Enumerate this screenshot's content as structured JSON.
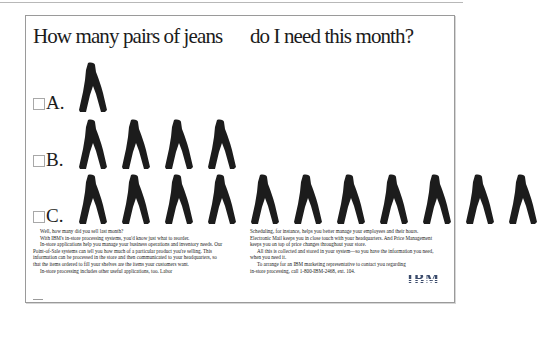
{
  "advertisement": {
    "brand": "IBM",
    "headline": {
      "left": "How many pairs of jeans",
      "right": "do I need this month?"
    },
    "choices": [
      {
        "label": "A.",
        "jeans_count": 1,
        "checked": false
      },
      {
        "label": "B.",
        "jeans_count": 4,
        "checked": false
      },
      {
        "label": "C.",
        "jeans_count": 10,
        "checked": false
      }
    ],
    "body_copy": {
      "left_column": [
        "Well, how many did you sell last month?",
        "With IBM's in-store processing systems, you'd know just what to reorder.",
        "In-store applications help you manage your business operations and inventory needs. Our Point-of-Sale systems can tell you how much of a particular product you're selling. This information can be processed in the store and then communicated to your headquarters, so that the items ordered to fill your shelves are the items your customers want.",
        "In-store processing includes other useful applications, too. Labor"
      ],
      "right_column": [
        "Scheduling, for instance, helps you better manage your employees and their hours. Electronic Mail keeps you in close touch with your headquarters. And Price Management keeps you on top of price changes throughout your store.",
        "All this is collected and stored in your system—so you have the information you need, when you need it.",
        "To arrange for an IBM marketing representative to contact you regarding in-store processing, call 1-800-IBM-2468, ext. 104."
      ]
    },
    "logo_text": "IBM",
    "icons": {
      "checkbox": "empty-checkbox-icon",
      "product": "jeans-icon"
    },
    "colors": {
      "text": "#1b1b1b",
      "frame_border": "#9a9a9a",
      "checkbox_border": "#a8a8a8",
      "jeans": "#1c1c1c",
      "logo": "#3b4b6b"
    }
  }
}
